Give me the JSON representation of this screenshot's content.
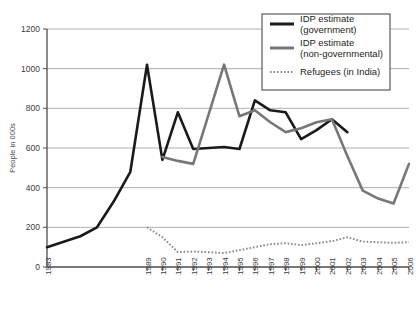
{
  "chart_data": {
    "type": "line",
    "title": "",
    "xlabel": "",
    "ylabel": "People in 000s",
    "ylim": [
      0,
      1200
    ],
    "yticks": [
      0,
      200,
      400,
      600,
      800,
      1000,
      1200
    ],
    "ytick_labels": [
      "0",
      "200",
      "400",
      "600",
      "800",
      "1000",
      "1200"
    ],
    "grid": true,
    "legend_position": "top-right",
    "x": [
      1983,
      1984,
      1985,
      1986,
      1987,
      1988,
      1989,
      1990,
      1991,
      1992,
      1993,
      1994,
      1995,
      1996,
      1997,
      1998,
      1999,
      2000,
      2001,
      2002,
      2003,
      2004,
      2005,
      2006
    ],
    "xtick_labels": [
      "1983",
      "",
      "",
      "",
      "",
      "",
      "1989",
      "1990",
      "1991",
      "1992",
      "1993",
      "1994",
      "1995",
      "1996",
      "1997",
      "1998",
      "1999",
      "2000",
      "2001",
      "2002",
      "2003",
      "2004",
      "2005",
      "2006"
    ],
    "series": [
      {
        "name": "IDP estimate (government)",
        "color": "#1a1a1a",
        "style": "solid",
        "width": 2.6,
        "points": [
          {
            "x": 1983,
            "y": 100
          },
          {
            "x": 1985,
            "y": 155
          },
          {
            "x": 1986,
            "y": 200
          },
          {
            "x": 1987,
            "y": 330
          },
          {
            "x": 1988,
            "y": 480
          },
          {
            "x": 1989,
            "y": 1020
          },
          {
            "x": 1990,
            "y": 540
          },
          {
            "x": 1991,
            "y": 780
          },
          {
            "x": 1992,
            "y": 595
          },
          {
            "x": 1993,
            "y": 600
          },
          {
            "x": 1994,
            "y": 605
          },
          {
            "x": 1995,
            "y": 595
          },
          {
            "x": 1996,
            "y": 840
          },
          {
            "x": 1997,
            "y": 790
          },
          {
            "x": 1998,
            "y": 780
          },
          {
            "x": 1999,
            "y": 645
          },
          {
            "x": 2000,
            "y": 690
          },
          {
            "x": 2001,
            "y": 745
          },
          {
            "x": 2002,
            "y": 680
          }
        ]
      },
      {
        "name": "IDP estimate (non-governmental)",
        "color": "#777777",
        "style": "solid",
        "width": 2.6,
        "points": [
          {
            "x": 1990,
            "y": 555
          },
          {
            "x": 1991,
            "y": 535
          },
          {
            "x": 1992,
            "y": 520
          },
          {
            "x": 1993,
            "y": 770
          },
          {
            "x": 1994,
            "y": 1020
          },
          {
            "x": 1995,
            "y": 760
          },
          {
            "x": 1996,
            "y": 790
          },
          {
            "x": 1997,
            "y": 730
          },
          {
            "x": 1998,
            "y": 680
          },
          {
            "x": 1999,
            "y": 700
          },
          {
            "x": 2000,
            "y": 730
          },
          {
            "x": 2001,
            "y": 745
          },
          {
            "x": 2002,
            "y": 560
          },
          {
            "x": 2003,
            "y": 385
          },
          {
            "x": 2004,
            "y": 345
          },
          {
            "x": 2005,
            "y": 320
          },
          {
            "x": 2006,
            "y": 520
          }
        ]
      },
      {
        "name": "Refugees (in India)",
        "color": "#8a8a8a",
        "style": "dotted",
        "width": 2.0,
        "points": [
          {
            "x": 1989,
            "y": 200
          },
          {
            "x": 1990,
            "y": 150
          },
          {
            "x": 1991,
            "y": 75
          },
          {
            "x": 1992,
            "y": 78
          },
          {
            "x": 1993,
            "y": 75
          },
          {
            "x": 1994,
            "y": 70
          },
          {
            "x": 1995,
            "y": 85
          },
          {
            "x": 1996,
            "y": 100
          },
          {
            "x": 1997,
            "y": 115
          },
          {
            "x": 1998,
            "y": 120
          },
          {
            "x": 1999,
            "y": 110
          },
          {
            "x": 2000,
            "y": 120
          },
          {
            "x": 2001,
            "y": 130
          },
          {
            "x": 2002,
            "y": 150
          },
          {
            "x": 2003,
            "y": 128
          },
          {
            "x": 2004,
            "y": 125
          },
          {
            "x": 2005,
            "y": 122
          },
          {
            "x": 2006,
            "y": 125
          }
        ]
      }
    ]
  },
  "legend": {
    "items": [
      {
        "label_line1": "IDP estimate",
        "label_line2": "(government)",
        "swatch": "black-solid-line"
      },
      {
        "label_line1": "IDP estimate",
        "label_line2": "(non-governmental)",
        "swatch": "gray-solid-line"
      },
      {
        "label_line1": "Refugees (in India)",
        "label_line2": "",
        "swatch": "gray-dotted-line"
      }
    ]
  },
  "colors": {
    "government": "#1a1a1a",
    "non_governmental": "#777777",
    "refugees": "#8a8a8a",
    "grid": "#9a9a9a",
    "axis": "#4d4d4d",
    "background": "#ffffff"
  }
}
